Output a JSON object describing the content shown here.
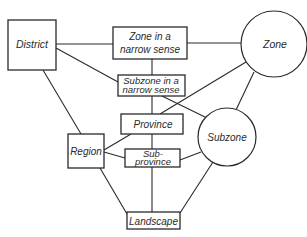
{
  "diagram": {
    "type": "hierarchy-relationship-diagram",
    "nodes": {
      "district": {
        "label": "District",
        "shape": "rectangle"
      },
      "zone_narrow": {
        "label_line1": "Zone in a",
        "label_line2": "narrow sense",
        "shape": "rectangle"
      },
      "zone": {
        "label": "Zone",
        "shape": "circle"
      },
      "subzone_narrow": {
        "label_line1": "Subzone in a",
        "label_line2": "narrow sense",
        "shape": "rectangle"
      },
      "province": {
        "label": "Province",
        "shape": "rectangle"
      },
      "region": {
        "label": "Region",
        "shape": "rectangle"
      },
      "subzone": {
        "label": "Subzone",
        "shape": "circle"
      },
      "subprovince": {
        "label_line1": "Sub-",
        "label_line2": "province",
        "shape": "rectangle"
      },
      "landscape": {
        "label": "Landscape",
        "shape": "rectangle"
      }
    },
    "edges": [
      [
        "District",
        "Zone in a narrow sense"
      ],
      [
        "District",
        "Subzone in a narrow sense"
      ],
      [
        "District",
        "Region"
      ],
      [
        "Zone in a narrow sense",
        "Zone"
      ],
      [
        "Zone in a narrow sense",
        "Subzone in a narrow sense"
      ],
      [
        "Zone",
        "Province"
      ],
      [
        "Zone",
        "Subzone"
      ],
      [
        "Subzone in a narrow sense",
        "Province"
      ],
      [
        "Subzone in a narrow sense",
        "Subzone"
      ],
      [
        "Province",
        "Region"
      ],
      [
        "Province",
        "Sub-province"
      ],
      [
        "Region",
        "Sub-province"
      ],
      [
        "Region",
        "Landscape"
      ],
      [
        "Sub-province",
        "Subzone"
      ],
      [
        "Sub-province",
        "Landscape"
      ],
      [
        "Subzone",
        "Landscape"
      ]
    ],
    "colors": {
      "stroke": "#2a2a2a",
      "background": "#ffffff"
    }
  }
}
